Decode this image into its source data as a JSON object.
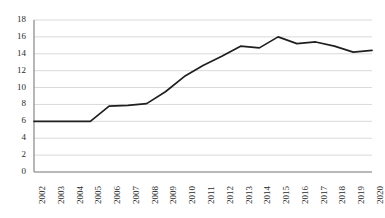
{
  "chart_data": {
    "type": "line",
    "title": "",
    "subtitle": "",
    "xlabel": "",
    "ylabel": "",
    "grid": true,
    "legend": false,
    "legend_position": "none",
    "xlim": [
      "2002",
      "2020"
    ],
    "ylim": [
      0,
      18
    ],
    "ytick_step": 2,
    "yticks": [
      18,
      16,
      14,
      12,
      10,
      8,
      6,
      4,
      2,
      0
    ],
    "categories": [
      "2002",
      "2003",
      "2004",
      "2005",
      "2006",
      "2007",
      "2008",
      "2009",
      "2010",
      "2011",
      "2012",
      "2013",
      "2014",
      "2015",
      "2016",
      "2017",
      "2018",
      "2019",
      "2020"
    ],
    "values": [
      6.0,
      6.0,
      6.0,
      6.0,
      7.8,
      7.9,
      8.1,
      9.5,
      11.3,
      12.6,
      13.7,
      14.9,
      14.7,
      16.0,
      15.2,
      15.4,
      14.9,
      14.2,
      14.4
    ],
    "series": [
      {
        "name": "series-1",
        "values": [
          6.0,
          6.0,
          6.0,
          6.0,
          7.8,
          7.9,
          8.1,
          9.5,
          11.3,
          12.6,
          13.7,
          14.9,
          14.7,
          16.0,
          15.2,
          15.4,
          14.9,
          14.2,
          14.4
        ],
        "color": "#1f1f1f"
      }
    ],
    "line_color": "#1f1f1f",
    "grid_color": "#d9d9d9",
    "axis_color": "#868686",
    "background": "#ffffff"
  },
  "plot_geometry": {
    "left": 34,
    "right": 372,
    "top": 20,
    "bottom": 172
  }
}
